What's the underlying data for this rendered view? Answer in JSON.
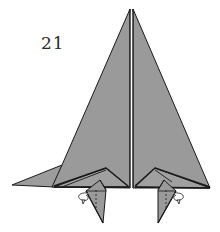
{
  "step": {
    "number": "21"
  },
  "diagram": {
    "colors": {
      "paper_fill": "#9a9a9a",
      "paper_fill_light": "#a4a4a4",
      "edge_stroke": "#1a1a1a",
      "background": "#ffffff"
    },
    "annotations": [
      {
        "type": "fold-arrow",
        "side": "left"
      },
      {
        "type": "fold-arrow",
        "side": "right"
      },
      {
        "type": "hidden-line",
        "style": "dashed",
        "side": "left"
      },
      {
        "type": "hidden-line",
        "style": "dashed",
        "side": "right"
      }
    ]
  }
}
